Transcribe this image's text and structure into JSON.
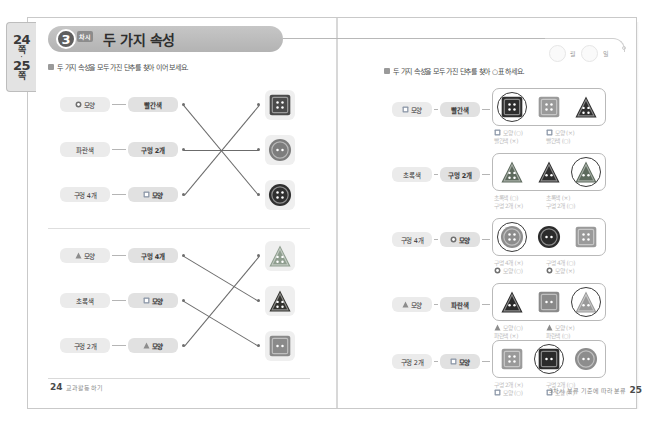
{
  "tab": {
    "page_a": "24",
    "unit_a": "쪽",
    "dot": "·",
    "page_b": "25",
    "unit_b": "쪽"
  },
  "banner": {
    "lesson_number": "3",
    "lesson_sub": "차시",
    "title": "두 가지 속성"
  },
  "left_page": {
    "instruction": "두 가지 속성을 모두 가진 단추를 찾아 이어 보세요.",
    "group_top": {
      "pairs": [
        {
          "a": "모양",
          "a_icon": "circle-shape-icon",
          "b": "빨간색",
          "b_icon": "none"
        },
        {
          "a": "파란색",
          "a_icon": "none",
          "b": "구멍 2개",
          "b_icon": "none"
        },
        {
          "a": "구멍 4개",
          "a_icon": "none",
          "b": "모양",
          "b_icon": "square-shape-icon"
        }
      ],
      "targets": [
        {
          "name": "square-button-4holes",
          "shape": "square",
          "color": "#4a4a4a",
          "holes": 4
        },
        {
          "name": "circle-button-2holes",
          "shape": "circle",
          "color": "#7d7d7d",
          "holes": 2
        },
        {
          "name": "circle-button-4holes",
          "shape": "circle",
          "color": "#2f2f2f",
          "holes": 4
        }
      ],
      "links": [
        [
          0,
          2
        ],
        [
          1,
          1
        ],
        [
          2,
          0
        ]
      ]
    },
    "group_bottom": {
      "pairs": [
        {
          "a": "모양",
          "a_icon": "triangle-shape-icon",
          "b": "구멍 4개",
          "b_icon": "none"
        },
        {
          "a": "초록색",
          "a_icon": "none",
          "b": "모양",
          "b_icon": "square-shape-icon"
        },
        {
          "a": "구멍 2개",
          "a_icon": "none",
          "b": "모양",
          "b_icon": "triangle-shape-icon"
        }
      ],
      "targets": [
        {
          "name": "triangle-button-green-4holes",
          "shape": "triangle",
          "color": "#8f9e8f",
          "holes": 4
        },
        {
          "name": "triangle-button-dark-4holes",
          "shape": "triangle",
          "color": "#33332f",
          "holes": 4
        },
        {
          "name": "square-button-2holes",
          "shape": "square",
          "color": "#8a8a8a",
          "holes": 2
        }
      ],
      "links": [
        [
          0,
          1
        ],
        [
          1,
          2
        ],
        [
          2,
          0
        ]
      ]
    },
    "footer": {
      "page": "24",
      "text": "교과활동 하기"
    }
  },
  "right_page": {
    "date": {
      "month_label": "월",
      "day_label": "일"
    },
    "instruction": "두 가지 속성을 모두 가진 단추를 찾아 ○표 하세요.",
    "rows": [
      {
        "cond_a": "모양",
        "cond_a_icon": "square-shape-icon",
        "cond_b": "빨간색",
        "cond_b_icon": "none",
        "options": [
          {
            "name": "square-button-red-4holes",
            "shape": "square",
            "color": "#2e2e2e",
            "holes": 4,
            "answer": true
          },
          {
            "name": "square-button-gray-4holes",
            "shape": "square",
            "color": "#9a9a9a",
            "holes": 4,
            "answer": false
          },
          {
            "name": "triangle-button-dark-4holes",
            "shape": "triangle",
            "color": "#2e2e2e",
            "holes": 4,
            "answer": false
          }
        ],
        "notes": [
          {
            "l1": "모양 (○)",
            "l1_icon": "square-shape-icon",
            "l2": "빨간색 (×)",
            "l2_icon": "none"
          },
          {
            "l1": "모양 (×)",
            "l1_icon": "square-shape-icon",
            "l2": "빨간색 (○)",
            "l2_icon": "none"
          }
        ]
      },
      {
        "cond_a": "초록색",
        "cond_a_icon": "none",
        "cond_b": "구멍 2개",
        "cond_b_icon": "none",
        "options": [
          {
            "name": "triangle-button-green-4holes",
            "shape": "triangle",
            "color": "#5e6b5e",
            "holes": 4,
            "answer": false
          },
          {
            "name": "triangle-button-dark-2holes",
            "shape": "triangle",
            "color": "#2e2e2e",
            "holes": 2,
            "answer": false
          },
          {
            "name": "triangle-button-green-2holes",
            "shape": "triangle",
            "color": "#5e6b5e",
            "holes": 2,
            "answer": true
          }
        ],
        "notes": [
          {
            "l1": "초록색 (○)",
            "l1_icon": "none",
            "l2": "구멍 2개 (×)",
            "l2_icon": "none"
          },
          {
            "l1": "초록색 (×)",
            "l1_icon": "none",
            "l2": "구멍 2개 (○)",
            "l2_icon": "none"
          }
        ]
      },
      {
        "cond_a": "구멍 4개",
        "cond_a_icon": "none",
        "cond_b": "모양",
        "cond_b_icon": "circle-shape-icon",
        "options": [
          {
            "name": "circle-button-gray-4holes",
            "shape": "circle",
            "color": "#8d8d8d",
            "holes": 4,
            "answer": true
          },
          {
            "name": "circle-button-dark-2holes",
            "shape": "circle",
            "color": "#2b2b2b",
            "holes": 2,
            "answer": false
          },
          {
            "name": "square-button-gray-4holes",
            "shape": "square",
            "color": "#9a9a9a",
            "holes": 4,
            "answer": false
          }
        ],
        "notes": [
          {
            "l1": "구멍 4개 (×)",
            "l1_icon": "none",
            "l2": "모양 (○)",
            "l2_icon": "circle-shape-icon"
          },
          {
            "l1": "구멍 4개 (○)",
            "l1_icon": "none",
            "l2": "모양 (×)",
            "l2_icon": "circle-shape-icon"
          }
        ]
      },
      {
        "cond_a": "모양",
        "cond_a_icon": "triangle-shape-icon",
        "cond_b": "파란색",
        "cond_b_icon": "none",
        "options": [
          {
            "name": "triangle-button-dark-2holes",
            "shape": "triangle",
            "color": "#2b2b2b",
            "holes": 2,
            "answer": false
          },
          {
            "name": "square-button-gray-2holes",
            "shape": "square",
            "color": "#8a8a8a",
            "holes": 2,
            "answer": false
          },
          {
            "name": "triangle-button-gray-2holes",
            "shape": "triangle",
            "color": "#9a9a9a",
            "holes": 2,
            "answer": true
          }
        ],
        "notes": [
          {
            "l1": "모양 (○)",
            "l1_icon": "triangle-shape-icon",
            "l2": "파란색 (×)",
            "l2_icon": "none"
          },
          {
            "l1": "모양 (×)",
            "l1_icon": "triangle-shape-icon",
            "l2": "파란색 (○)",
            "l2_icon": "none"
          }
        ]
      },
      {
        "cond_a": "구멍 2개",
        "cond_a_icon": "none",
        "cond_b": "모양",
        "cond_b_icon": "square-shape-icon",
        "options": [
          {
            "name": "square-button-gray-4holes",
            "shape": "square",
            "color": "#9a9a9a",
            "holes": 4,
            "answer": false
          },
          {
            "name": "square-button-dark-2holes",
            "shape": "square",
            "color": "#2b2b2b",
            "holes": 2,
            "answer": true
          },
          {
            "name": "circle-button-gray-2holes",
            "shape": "circle",
            "color": "#8d8d8d",
            "holes": 2,
            "answer": false
          }
        ],
        "notes": [
          {
            "l1": "구멍 2개 (×)",
            "l1_icon": "none",
            "l2": "모양 (○)",
            "l2_icon": "square-shape-icon"
          },
          {
            "l1": "구멍 2개 (○)",
            "l1_icon": "none",
            "l2": "모양 (×)",
            "l2_icon": "square-shape-icon"
          }
        ]
      }
    ],
    "footer": {
      "text": "3차시 분류 기준에 따라 분류",
      "page": "25"
    }
  }
}
